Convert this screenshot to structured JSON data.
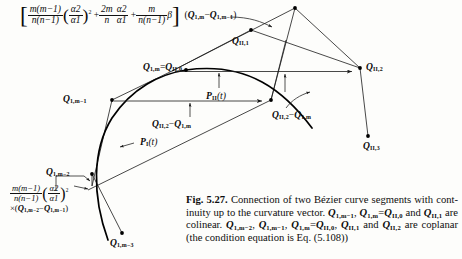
{
  "figure": {
    "number": "Fig. 5.27.",
    "caption_text": "Connection of two Bézier curve segments with continuity up to the curvature vector. Q1,m−1, Q1,m = QII,0 and QII,1 are colinear. Q1,m−2, Q1,m−1, Q1,m = QII,0, QII,1 and QII,2 are coplanar (the condition equation is Eq. (5.108))"
  },
  "caption": {
    "label": "Fig. 5.27.",
    "seg1": "Connection of two Bézier curve segments with cont-",
    "seg2_a": "inuity up to the curvature vector.",
    "seg2_q1": "Q",
    "seg2_q1sub": "1,m−1",
    "seg2_comma1": ",",
    "seg2_q2": "Q",
    "seg2_q2sub": "1,m",
    "seg2_eq": "=",
    "seg2_q3": "Q",
    "seg2_q3sub": "II,0",
    "seg2_and": "and",
    "seg2_q4": "Q",
    "seg2_q4sub": "II,1",
    "seg3_a": "are colinear.",
    "seg3_q1": "Q",
    "seg3_q1sub": "1,m−2",
    "seg3_q2": "Q",
    "seg3_q2sub": "1,m−1",
    "seg3_q3": "Q",
    "seg3_q3sub": "1,m",
    "seg3_eq": "=",
    "seg3_q4": "Q",
    "seg3_q4sub": "II,0",
    "seg3_q5": "Q",
    "seg3_q5sub": "II,1",
    "seg3_and": "and",
    "seg3_q6": "Q",
    "seg3_q6sub": "II,2",
    "seg3_are": "are",
    "seg4": "coplanar (the condition equation is Eq. (5.108))"
  },
  "formula_top": {
    "bracket_open": "[",
    "bracket_close": "]",
    "f1_num": "m(m−1)",
    "f1_den": "n(n−1)",
    "paren_open": "(",
    "paren_close": ")",
    "f2_num": "α2",
    "f2_den": "α1",
    "exp2": "2",
    "plus1": "+",
    "f3_num": "2m",
    "f3_den": "n",
    "f4_num": "α2",
    "f4_den": "α1",
    "plus2": "+",
    "f5_num": "m",
    "f5_den": "n(n−1)",
    "beta": "β",
    "vec_open": "(",
    "vec_q1": "Q",
    "vec_q1sub": "1,m",
    "vec_minus": "−",
    "vec_q2": "Q",
    "vec_q2sub": "1,m−1",
    "vec_close": ")"
  },
  "formula_bottom": {
    "f1_num": "m(m−1)",
    "f1_den": "n(n−1)",
    "paren_open": "(",
    "paren_close": ")",
    "f2_num": "α2",
    "f2_den": "α1",
    "exp2": "2",
    "times": "×",
    "vec_open": "(",
    "vec_q1": "Q",
    "vec_q1sub": "1,m−2",
    "vec_minus": "−",
    "vec_q2": "Q",
    "vec_q2sub": "1,m−1",
    "vec_close": ")"
  },
  "diagram": {
    "points": [
      {
        "id": "Q1m_QII0",
        "base": "Q",
        "sub": "1,m",
        "eq": "=",
        "base2": "Q",
        "sub2": "II,0",
        "x": 203,
        "y": 67
      },
      {
        "id": "QII1",
        "base": "Q",
        "sub": "II,1",
        "x": 244,
        "y": 38
      },
      {
        "id": "QII2",
        "base": "Q",
        "sub": "II,2",
        "x": 363,
        "y": 65
      },
      {
        "id": "QII3",
        "base": "Q",
        "sub": "II,3",
        "x": 370,
        "y": 142
      },
      {
        "id": "Q1m-1",
        "base": "Q",
        "sub": "1,m−1",
        "x": 80,
        "y": 98
      },
      {
        "id": "Q1m-2",
        "base": "Q",
        "sub": "1,m−2",
        "x": 76,
        "y": 170
      },
      {
        "id": "Q1m-3",
        "base": "Q",
        "sub": "1,m−3",
        "x": 122,
        "y": 240
      }
    ],
    "curve_labels": [
      {
        "id": "PII",
        "base": "P",
        "sub": "II",
        "arg": "(t)",
        "x": 222,
        "y": 95
      },
      {
        "id": "PI",
        "base": "P",
        "sub": "I",
        "arg": "(t)",
        "x": 137,
        "y": 141
      }
    ],
    "vector_labels": [
      {
        "id": "QII2-Q1m-horizontal",
        "q1": "Q",
        "s1": "II,2",
        "minus": "−",
        "q2": "Q",
        "s2": "1,m",
        "x": 168,
        "y": 122
      },
      {
        "id": "QII2-Q1m-diagonal",
        "q1": "Q",
        "s1": "II,2",
        "minus": "−",
        "q2": "Q",
        "s2": "1,m",
        "x": 283,
        "y": 112
      }
    ],
    "colors": {
      "line": "#1a1a1a",
      "curve": "#000000",
      "background": "#fdfdfb"
    }
  }
}
